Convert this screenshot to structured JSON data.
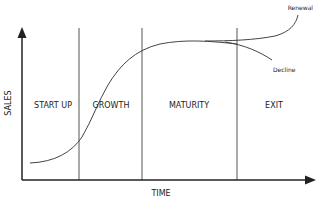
{
  "diagram": {
    "axes": {
      "x_label": "TIME",
      "y_label": "SALES"
    },
    "stages": [
      {
        "label": "START UP"
      },
      {
        "label": "GROWTH"
      },
      {
        "label": "MATURITY"
      },
      {
        "label": "EXIT"
      }
    ],
    "branches": {
      "upper": "Renewal",
      "lower": "Decline"
    },
    "colors": {
      "line": "#333333",
      "divider": "#555555",
      "text": "#222222",
      "background": "#ffffff"
    }
  }
}
